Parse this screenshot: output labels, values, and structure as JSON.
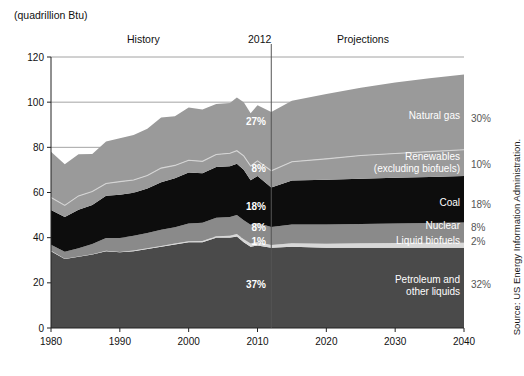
{
  "figure": {
    "unit_label": "(quadrillion Btu)",
    "source_note": "Source: US Energy Information Administration.",
    "history_label": "History",
    "projections_label": "Projections",
    "divider_year_label": "2012"
  },
  "chart_data": {
    "type": "area",
    "title": "",
    "subtitle": "",
    "xlabel": "",
    "ylabel": "(quadrillion Btu)",
    "stacked": true,
    "grid": true,
    "legend_position": "inline-right",
    "xlim": [
      1980,
      2040
    ],
    "ylim": [
      0,
      120
    ],
    "yticks": [
      0,
      20,
      40,
      60,
      80,
      100,
      120
    ],
    "ytick_labels": [
      "0",
      "20",
      "40",
      "60",
      "80",
      "100",
      "120"
    ],
    "xticks": [
      1980,
      1990,
      2000,
      2010,
      2020,
      2030,
      2040
    ],
    "xtick_labels": [
      "1980",
      "1990",
      "2000",
      "2010",
      "2020",
      "2030",
      "2040"
    ],
    "divider_x": 2012,
    "x": [
      1980,
      1982,
      1984,
      1986,
      1988,
      1990,
      1992,
      1994,
      1996,
      1998,
      2000,
      2002,
      2004,
      2006,
      2007,
      2008,
      2009,
      2010,
      2012,
      2015,
      2020,
      2025,
      2030,
      2035,
      2040
    ],
    "series": [
      {
        "name": "Petroleum and other liquids",
        "label": "Petroleum and\nother liquids",
        "color": "#4a4a4a",
        "pct_2012": "37%",
        "pct_2040": "32%",
        "values": [
          34.0,
          30.5,
          31.5,
          32.5,
          34.0,
          33.5,
          34.0,
          35.0,
          36.0,
          37.0,
          38.0,
          38.0,
          40.0,
          40.0,
          40.5,
          38.0,
          36.0,
          36.5,
          35.5,
          36.0,
          35.5,
          35.5,
          35.5,
          35.5,
          35.5
        ]
      },
      {
        "name": "Liquid biofuels",
        "label": "Liquid biofuels",
        "color": "#d8d8d8",
        "pct_2012": "1%",
        "pct_2040": "2%",
        "values": [
          0.2,
          0.2,
          0.2,
          0.2,
          0.2,
          0.2,
          0.3,
          0.3,
          0.3,
          0.4,
          0.4,
          0.5,
          0.6,
          0.9,
          1.1,
          1.3,
          1.4,
          1.6,
          1.2,
          1.5,
          1.8,
          2.0,
          2.1,
          2.2,
          2.3
        ]
      },
      {
        "name": "Nuclear",
        "label": "Nuclear",
        "color": "#8a8a8a",
        "pct_2012": "8%",
        "pct_2040": "8%",
        "values": [
          2.7,
          3.1,
          3.6,
          4.5,
          5.6,
          6.1,
          6.5,
          6.8,
          7.2,
          7.2,
          7.9,
          8.1,
          8.2,
          8.2,
          8.4,
          8.4,
          8.3,
          8.4,
          8.0,
          8.3,
          8.5,
          8.6,
          8.7,
          8.8,
          8.9
        ]
      },
      {
        "name": "Coal",
        "label": "Coal",
        "color": "#0d0d0d",
        "pct_2012": "18%",
        "pct_2040": "18%",
        "values": [
          15.4,
          15.3,
          17.1,
          17.3,
          18.8,
          19.2,
          19.1,
          19.7,
          21.0,
          21.7,
          22.6,
          21.9,
          22.5,
          22.5,
          22.7,
          22.4,
          19.7,
          20.8,
          17.5,
          19.5,
          19.8,
          20.0,
          20.2,
          20.4,
          20.6
        ]
      },
      {
        "name": "Renewables (excluding biofuels)",
        "label": "Renewables\n(excluding biofuels)",
        "color": "#9a9a9a",
        "pct_2012": "8%",
        "pct_2040": "10%",
        "values": [
          5.5,
          5.2,
          6.1,
          5.9,
          5.4,
          5.8,
          5.6,
          5.7,
          6.3,
          5.7,
          5.4,
          5.3,
          5.5,
          5.8,
          5.8,
          6.1,
          6.3,
          6.7,
          7.4,
          8.3,
          9.3,
          10.3,
          10.8,
          11.2,
          11.6
        ]
      },
      {
        "name": "Natural gas",
        "label": "Natural gas",
        "color": "#9a9a9a",
        "pct_2012": "27%",
        "pct_2040": "30%",
        "values": [
          20.2,
          18.2,
          18.4,
          16.6,
          18.6,
          19.2,
          20.0,
          20.7,
          22.4,
          21.8,
          23.3,
          23.0,
          22.4,
          22.2,
          23.6,
          23.8,
          23.4,
          24.6,
          26.0,
          27.0,
          28.7,
          30.0,
          31.4,
          32.5,
          33.4
        ]
      }
    ],
    "totals_note": "Stacked total US primary energy consumption"
  },
  "annotations": {
    "pct_2012_x_label": "2012",
    "pct_2040_x_label": "2040"
  }
}
